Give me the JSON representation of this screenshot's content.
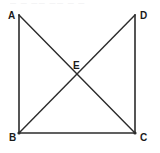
{
  "figure": {
    "width": 160,
    "height": 153,
    "background_color": "#ffffff",
    "stroke_color": "#2b2b2b",
    "label_color": "#1a1a1a",
    "top_artifact_text": "— — —— —— — —",
    "points": [
      {
        "id": "A",
        "label": "A",
        "x": 18,
        "y": 15,
        "label_x": 8,
        "label_y": 11
      },
      {
        "id": "D",
        "label": "D",
        "x": 135,
        "y": 15,
        "label_x": 140,
        "label_y": 11
      },
      {
        "id": "B",
        "label": "B",
        "x": 19,
        "y": 133,
        "label_x": 9,
        "label_y": 133
      },
      {
        "id": "C",
        "label": "C",
        "x": 135,
        "y": 133,
        "label_x": 140,
        "label_y": 133
      },
      {
        "id": "E",
        "label": "E",
        "x": 77,
        "y": 76,
        "label_x": 73,
        "label_y": 61
      }
    ],
    "segments": [
      {
        "name": "side-AB",
        "from": "A",
        "to": "B",
        "x1": 19,
        "y1": 15,
        "x2": 19,
        "y2": 133,
        "width": 1.6
      },
      {
        "name": "side-BC",
        "from": "B",
        "to": "C",
        "x1": 19,
        "y1": 133,
        "x2": 135,
        "y2": 133,
        "width": 1.6
      },
      {
        "name": "side-DC",
        "from": "D",
        "to": "C",
        "x1": 135,
        "y1": 15,
        "x2": 135,
        "y2": 133,
        "width": 1.6
      },
      {
        "name": "diagonal-AC",
        "from": "A",
        "to": "C",
        "x1": 19,
        "y1": 15,
        "x2": 135,
        "y2": 133,
        "width": 1.4
      },
      {
        "name": "diagonal-BD",
        "from": "B",
        "to": "D",
        "x1": 19,
        "y1": 133,
        "x2": 135,
        "y2": 15,
        "width": 1.4
      }
    ]
  }
}
